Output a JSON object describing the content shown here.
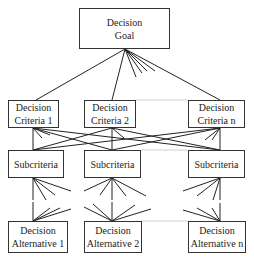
{
  "diagram": {
    "type": "AHP hierarchy",
    "goal": {
      "line1": "Decision",
      "line2": "Goal"
    },
    "criteria": [
      {
        "line1": "Decision",
        "line2": "Criteria 1"
      },
      {
        "line1": "Decision",
        "line2": "Criteria 2"
      },
      {
        "line1": "Decision",
        "line2": "Criteria n"
      }
    ],
    "subcriteria": [
      {
        "label": "Subcriteria"
      },
      {
        "label": "Subcriteria"
      },
      {
        "label": "Subcriteria"
      }
    ],
    "alternatives": [
      {
        "line1": "Decision",
        "line2": "Alternative 1"
      },
      {
        "line1": "Decision",
        "line2": "Alternative 2"
      },
      {
        "line1": "Decision",
        "line2": "Alternative n"
      }
    ],
    "colors": {
      "line": "#222222",
      "box_border": "#333333",
      "connector_faint": "#cccccc"
    }
  }
}
